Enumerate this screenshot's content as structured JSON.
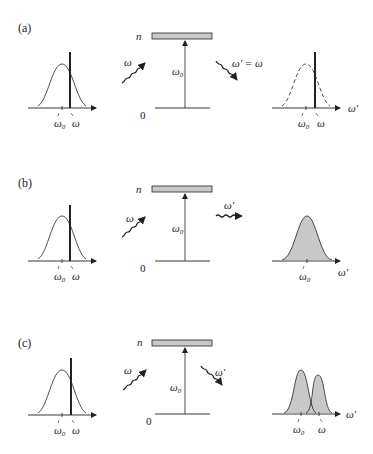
{
  "figure": {
    "colors": {
      "line": "#222222",
      "fill_gray": "#c8c8c8",
      "level_bar": "#c8c8c8",
      "background": "#ffffff"
    },
    "panels": [
      {
        "label": "(a)",
        "incident_spectrum": {
          "axis_ticks": [
            "ω0",
            "ω"
          ],
          "line_label": "ω"
        },
        "level_diagram": {
          "upper_level": "n",
          "lower_level": "0",
          "transition": "ω0",
          "incoming_photon": "ω",
          "outgoing_photon": "ω' = ω",
          "outgoing_direction": "down-right"
        },
        "emitted_spectrum": {
          "style": "dashed-curve-with-line",
          "axis_label": "ω'",
          "axis_ticks": [
            "ω0",
            "ω"
          ]
        }
      },
      {
        "label": "(b)",
        "incident_spectrum": {
          "axis_ticks": [
            "ω0",
            "ω"
          ],
          "line_label": "ω"
        },
        "level_diagram": {
          "upper_level": "n",
          "lower_level": "0",
          "transition": "ω0",
          "incoming_photon": "ω",
          "outgoing_photon": "ω'",
          "outgoing_direction": "right"
        },
        "emitted_spectrum": {
          "style": "filled-single-peak",
          "axis_label": "ω'",
          "axis_ticks": [
            "ω0"
          ]
        }
      },
      {
        "label": "(c)",
        "incident_spectrum": {
          "axis_ticks": [
            "ω0",
            "ω"
          ],
          "line_label": "ω"
        },
        "level_diagram": {
          "upper_level": "n",
          "lower_level": "0",
          "transition": "ω0",
          "incoming_photon": "ω",
          "outgoing_photon": "ω'",
          "outgoing_direction": "down-right"
        },
        "emitted_spectrum": {
          "style": "filled-double-peak",
          "axis_label": "ω'",
          "axis_ticks": [
            "ω0",
            "ω"
          ]
        }
      }
    ]
  },
  "text": {
    "a": "(a)",
    "b": "(b)",
    "c": "(c)",
    "n": "n",
    "zero": "0",
    "omega": "ω",
    "omega0_base": "ω",
    "omega0_sub": "0",
    "omega_prime": "ω'",
    "omega_prime_eq": "ω' = ω"
  }
}
